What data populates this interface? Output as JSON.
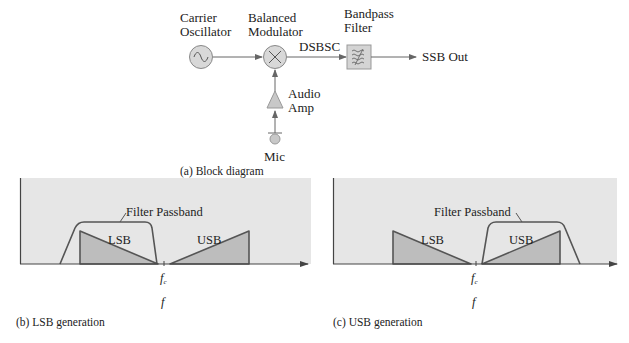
{
  "block_diagram": {
    "caption": "(a) Block diagram",
    "carrier_oscillator": {
      "line1": "Carrier",
      "line2": "Oscillator",
      "icon": "sine-wave-icon"
    },
    "balanced_modulator": {
      "line1": "Balanced",
      "line2": "Modulator",
      "icon": "multiply-icon"
    },
    "bandpass_filter": {
      "line1": "Bandpass",
      "line2": "Filter",
      "icon": "filter-wave-icon"
    },
    "dsbsc_label": "DSBSC",
    "output_label": "SSB Out",
    "audio_amp": {
      "line1": "Audio",
      "line2": "Amp",
      "icon": "amplifier-triangle-icon"
    },
    "mic": {
      "label": "Mic",
      "icon": "microphone-icon"
    }
  },
  "spectra": [
    {
      "id": "lsb",
      "caption": "(b) LSB generation",
      "filter_label": "Filter Passband",
      "lsb_label": "LSB",
      "usb_label": "USB",
      "carrier_label": "f",
      "carrier_sub": "c",
      "axis_label": "f"
    },
    {
      "id": "usb",
      "caption": "(c) USB generation",
      "filter_label": "Filter Passband",
      "lsb_label": "LSB",
      "usb_label": "USB",
      "carrier_label": "f",
      "carrier_sub": "c",
      "axis_label": "f"
    }
  ],
  "colors": {
    "panel_bg": "#e6e6e6",
    "sideband_fill": "#bdbdbd",
    "line": "#555555",
    "block_fill": "#d8d8d8"
  }
}
